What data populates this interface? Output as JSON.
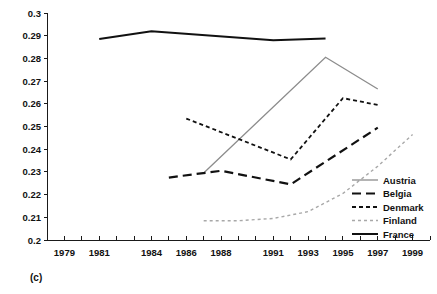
{
  "panel": {
    "label": "(c)"
  },
  "chart_data": {
    "type": "line",
    "title": "",
    "xlabel": "",
    "ylabel": "",
    "xlim": [
      1978,
      2000
    ],
    "ylim": [
      0.2,
      0.3
    ],
    "grid": false,
    "legend_position": "bottom-right",
    "x_ticks": [
      1979,
      1981,
      1984,
      1986,
      1988,
      1991,
      1993,
      1995,
      1997,
      1999
    ],
    "x_tick_labels": [
      "1979",
      "1981",
      "1984",
      "1986",
      "1988",
      "1991",
      "1993",
      "1995",
      "1997",
      "1999"
    ],
    "y_ticks": [
      0.2,
      0.21,
      0.22,
      0.23,
      0.24,
      0.25,
      0.26,
      0.27,
      0.28,
      0.29,
      0.3
    ],
    "y_tick_labels": [
      "0.2",
      "0.21",
      "0.22",
      "0.23",
      "0.24",
      "0.25",
      "0.26",
      "0.27",
      "0.28",
      "0.29",
      "0.3"
    ],
    "minor_x_ticks": [
      1978,
      1979,
      1980,
      1981,
      1982,
      1983,
      1984,
      1985,
      1986,
      1987,
      1988,
      1989,
      1990,
      1991,
      1992,
      1993,
      1994,
      1995,
      1996,
      1997,
      1998,
      1999,
      2000
    ],
    "series": [
      {
        "name": "Austria",
        "color": "#8c8c8c",
        "width": 1.3,
        "dash": "none",
        "x": [
          1987,
          1994,
          1997
        ],
        "values": [
          0.2295,
          0.2805,
          0.2665
        ]
      },
      {
        "name": "Belgia",
        "color": "#111111",
        "width": 2.2,
        "dash": "9,5",
        "x": [
          1985,
          1988,
          1992,
          1997
        ],
        "values": [
          0.2275,
          0.2305,
          0.2245,
          0.2495
        ]
      },
      {
        "name": "Denmark",
        "color": "#111111",
        "width": 1.8,
        "dash": "4,3",
        "x": [
          1986,
          1992,
          1995,
          1997
        ],
        "values": [
          0.2535,
          0.2355,
          0.2625,
          0.2595
        ]
      },
      {
        "name": "Finland",
        "color": "#a8a8a8",
        "width": 1.4,
        "dash": "3,3",
        "x": [
          1987,
          1989,
          1991,
          1993,
          1995,
          1997,
          1999
        ],
        "values": [
          0.2085,
          0.2085,
          0.2095,
          0.2125,
          0.2205,
          0.2325,
          0.2465
        ]
      },
      {
        "name": "France",
        "color": "#111111",
        "width": 2.0,
        "dash": "none",
        "x": [
          1981,
          1984,
          1991,
          1994
        ],
        "values": [
          0.2885,
          0.292,
          0.288,
          0.2888
        ]
      }
    ],
    "legend": [
      {
        "label": "Austria",
        "color": "#8c8c8c",
        "width": 1.3,
        "dash": "none"
      },
      {
        "label": "Belgia",
        "color": "#111111",
        "width": 2.2,
        "dash": "9,5"
      },
      {
        "label": "Denmark",
        "color": "#111111",
        "width": 1.8,
        "dash": "4,3"
      },
      {
        "label": "Finland",
        "color": "#a8a8a8",
        "width": 1.4,
        "dash": "3,3"
      },
      {
        "label": "France",
        "color": "#111111",
        "width": 2.0,
        "dash": "none"
      }
    ]
  }
}
